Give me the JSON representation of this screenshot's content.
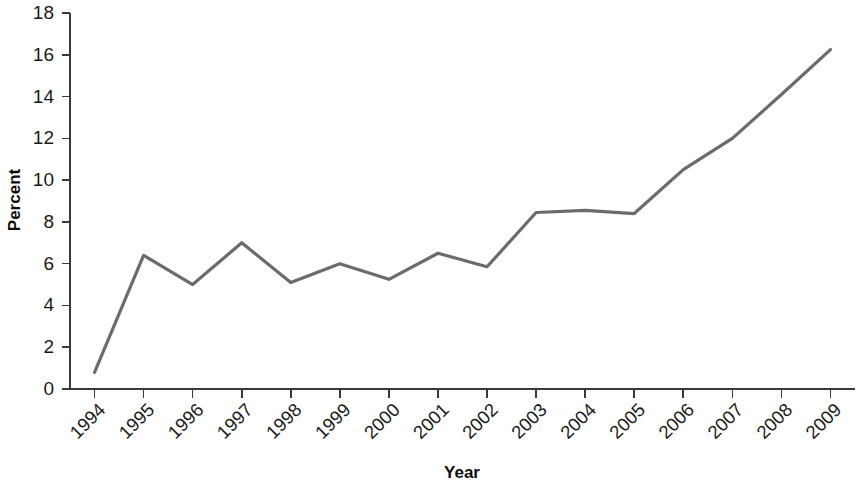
{
  "chart_data": {
    "type": "line",
    "title": "",
    "xlabel": "Year",
    "ylabel": "Percent",
    "categories": [
      "1994",
      "1995",
      "1996",
      "1997",
      "1998",
      "1999",
      "2000",
      "2001",
      "2002",
      "2003",
      "2004",
      "2005",
      "2006",
      "2007",
      "2008",
      "2009"
    ],
    "values": [
      0.8,
      6.4,
      5.0,
      7.0,
      5.1,
      6.0,
      5.25,
      6.5,
      5.85,
      8.45,
      8.55,
      8.4,
      10.5,
      12.0,
      14.1,
      16.25
    ],
    "series": [
      {
        "name": "Percent",
        "values": [
          0.8,
          6.4,
          5.0,
          7.0,
          5.1,
          6.0,
          5.25,
          6.5,
          5.85,
          8.45,
          8.55,
          8.4,
          10.5,
          12.0,
          14.1,
          16.25
        ],
        "color": "#6b6b6b"
      }
    ],
    "ylim": [
      0,
      18
    ],
    "yticks": [
      0,
      2,
      4,
      6,
      8,
      10,
      12,
      14,
      16,
      18
    ],
    "ytick_labels": [
      "0",
      "2",
      "4",
      "6",
      "8",
      "10",
      "12",
      "14",
      "16",
      "18"
    ],
    "xtick_labels": [
      "1994",
      "1995",
      "1996",
      "1997",
      "1998",
      "1999",
      "2000",
      "2001",
      "2002",
      "2003",
      "2004",
      "2005",
      "2006",
      "2007",
      "2008",
      "2009"
    ],
    "xtick_rotation": 45,
    "grid": false,
    "legend": false,
    "legend_position": "none",
    "line_color": "#6b6b6b",
    "axis_color": "#3a3a3a",
    "background_color": "#ffffff"
  }
}
